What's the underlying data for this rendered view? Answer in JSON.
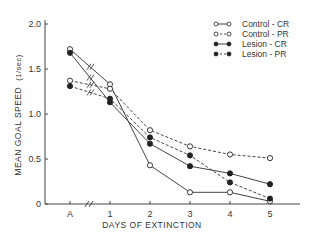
{
  "chart_data": {
    "type": "line",
    "title": "",
    "xlabel": "DAYS OF EXTINCTION",
    "ylabel": "MEAN GOAL SPEED",
    "ylabel_unit": "(1/sec)",
    "categories": [
      "A",
      "1",
      "2",
      "3",
      "4",
      "5"
    ],
    "axis_break_between": [
      "A",
      "1"
    ],
    "yticks": [
      "0",
      "0.5",
      "1.0",
      "1.5",
      "2.0"
    ],
    "ylim": [
      0,
      2.0
    ],
    "grid": false,
    "legend_position": "upper right",
    "series": [
      {
        "name": "Control - CR",
        "marker": "open-circle",
        "line": "solid",
        "values": [
          1.72,
          1.33,
          0.43,
          0.13,
          0.13,
          0.03
        ]
      },
      {
        "name": "Control - PR",
        "marker": "open-circle",
        "line": "dashed",
        "values": [
          1.37,
          1.28,
          0.82,
          0.64,
          0.55,
          0.51
        ]
      },
      {
        "name": "Lesion - CR",
        "marker": "filled-circle",
        "line": "solid",
        "values": [
          1.68,
          1.13,
          0.67,
          0.42,
          0.34,
          0.22
        ]
      },
      {
        "name": "Lesion - PR",
        "marker": "filled-circle",
        "line": "dashed",
        "values": [
          1.31,
          1.17,
          0.74,
          0.54,
          0.24,
          0.06
        ]
      }
    ]
  },
  "colors": {
    "line": "#444444",
    "text": "#333333",
    "background": "#ffffff"
  }
}
